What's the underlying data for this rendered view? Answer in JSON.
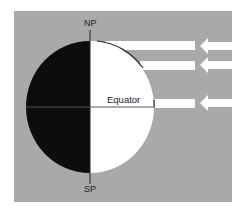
{
  "diagram": {
    "labels": {
      "north_pole": "NP",
      "south_pole": "SP",
      "equator": "Equator"
    },
    "colors": {
      "background": "#a9a9a9",
      "night_side": "#0d0d0d",
      "day_side": "#ffffff",
      "sun_rays": "#ffffff",
      "line": "#222222"
    },
    "sun_rays": [
      {
        "name": "ray-1"
      },
      {
        "name": "ray-2"
      },
      {
        "name": "ray-3"
      }
    ]
  }
}
